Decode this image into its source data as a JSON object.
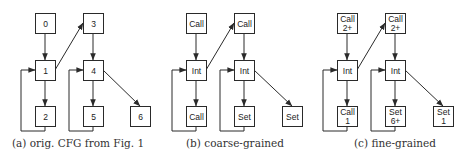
{
  "figure": {
    "node_size": 20,
    "colors": {
      "stroke": "#2a2a2a",
      "fill": "#ffffff",
      "text": "#222222",
      "caption": "#333333"
    },
    "panels": [
      {
        "id": "a",
        "caption": "(a) orig. CFG from Fig. 1",
        "caption_x": 78,
        "nodes": [
          {
            "id": "a0",
            "lines": [
              "0"
            ],
            "x": 35,
            "y": 13
          },
          {
            "id": "a1",
            "lines": [
              "1"
            ],
            "x": 35,
            "y": 60
          },
          {
            "id": "a2",
            "lines": [
              "2"
            ],
            "x": 35,
            "y": 106
          },
          {
            "id": "a3",
            "lines": [
              "3"
            ],
            "x": 83,
            "y": 13
          },
          {
            "id": "a4",
            "lines": [
              "4"
            ],
            "x": 83,
            "y": 60
          },
          {
            "id": "a5",
            "lines": [
              "5"
            ],
            "x": 83,
            "y": 106
          },
          {
            "id": "a6",
            "lines": [
              "6"
            ],
            "x": 130,
            "y": 106
          }
        ],
        "edges": [
          {
            "from": "a0",
            "to": "a1",
            "type": "down"
          },
          {
            "from": "a1",
            "to": "a3",
            "type": "diag-up"
          },
          {
            "from": "a1",
            "to": "a2",
            "type": "down"
          },
          {
            "from": "a2",
            "to": "a1",
            "type": "loop"
          },
          {
            "from": "a3",
            "to": "a4",
            "type": "down"
          },
          {
            "from": "a4",
            "to": "a5",
            "type": "down"
          },
          {
            "from": "a4",
            "to": "a6",
            "type": "diag-down"
          },
          {
            "from": "a5",
            "to": "a4",
            "type": "loop"
          }
        ]
      },
      {
        "id": "b",
        "caption": "(b) coarse-grained",
        "caption_x": 235,
        "nodes": [
          {
            "id": "b0",
            "lines": [
              "Call"
            ],
            "x": 186,
            "y": 13
          },
          {
            "id": "b1",
            "lines": [
              "Int"
            ],
            "x": 186,
            "y": 60
          },
          {
            "id": "b2",
            "lines": [
              "Call"
            ],
            "x": 186,
            "y": 106
          },
          {
            "id": "b3",
            "lines": [
              "Call"
            ],
            "x": 234,
            "y": 13
          },
          {
            "id": "b4",
            "lines": [
              "Int"
            ],
            "x": 234,
            "y": 60
          },
          {
            "id": "b5",
            "lines": [
              "Set"
            ],
            "x": 234,
            "y": 106
          },
          {
            "id": "b6",
            "lines": [
              "Set"
            ],
            "x": 282,
            "y": 106
          }
        ],
        "edges": [
          {
            "from": "b0",
            "to": "b1",
            "type": "down"
          },
          {
            "from": "b1",
            "to": "b3",
            "type": "diag-up"
          },
          {
            "from": "b1",
            "to": "b2",
            "type": "down"
          },
          {
            "from": "b2",
            "to": "b1",
            "type": "loop"
          },
          {
            "from": "b3",
            "to": "b4",
            "type": "down"
          },
          {
            "from": "b4",
            "to": "b5",
            "type": "down"
          },
          {
            "from": "b4",
            "to": "b6",
            "type": "diag-down"
          },
          {
            "from": "b5",
            "to": "b4",
            "type": "loop"
          }
        ]
      },
      {
        "id": "c",
        "caption": "(c) fine-grained",
        "caption_x": 395,
        "nodes": [
          {
            "id": "c0",
            "lines": [
              "Call",
              "2+"
            ],
            "x": 337,
            "y": 13
          },
          {
            "id": "c1",
            "lines": [
              "Int"
            ],
            "x": 337,
            "y": 60
          },
          {
            "id": "c2",
            "lines": [
              "Call",
              "1"
            ],
            "x": 337,
            "y": 106
          },
          {
            "id": "c3",
            "lines": [
              "Call",
              "2+"
            ],
            "x": 385,
            "y": 13
          },
          {
            "id": "c4",
            "lines": [
              "Int"
            ],
            "x": 385,
            "y": 60
          },
          {
            "id": "c5",
            "lines": [
              "Set",
              "6+"
            ],
            "x": 385,
            "y": 106
          },
          {
            "id": "c6",
            "lines": [
              "Set",
              "1"
            ],
            "x": 433,
            "y": 106
          }
        ],
        "edges": [
          {
            "from": "c0",
            "to": "c1",
            "type": "down"
          },
          {
            "from": "c1",
            "to": "c3",
            "type": "diag-up"
          },
          {
            "from": "c1",
            "to": "c2",
            "type": "down"
          },
          {
            "from": "c2",
            "to": "c1",
            "type": "loop"
          },
          {
            "from": "c3",
            "to": "c4",
            "type": "down"
          },
          {
            "from": "c4",
            "to": "c5",
            "type": "down"
          },
          {
            "from": "c4",
            "to": "c6",
            "type": "diag-down"
          },
          {
            "from": "c5",
            "to": "c4",
            "type": "loop"
          }
        ]
      }
    ]
  }
}
